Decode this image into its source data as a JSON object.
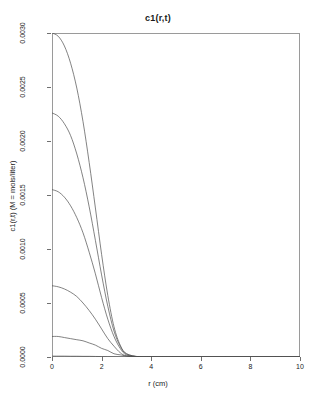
{
  "chart_data": {
    "type": "line",
    "title": "c1(r,t)",
    "xlabel": "r (cm)",
    "ylabel": "c1(r,t) (M = mols/liter)",
    "xlim": [
      0,
      10
    ],
    "ylim": [
      0,
      0.003
    ],
    "grid": false,
    "legend": "none",
    "xticks": [
      "0",
      "2",
      "4",
      "6",
      "8",
      "10"
    ],
    "xtick_values": [
      0,
      2,
      4,
      6,
      8,
      10
    ],
    "yticks": [
      "0.0000",
      "0.0005",
      "0.0010",
      "0.0015",
      "0.0020",
      "0.0025",
      "0.0030"
    ],
    "ytick_values": [
      0.0,
      0.0005,
      0.001,
      0.0015,
      0.002,
      0.0025,
      0.003
    ],
    "x": [
      0,
      0.25,
      0.5,
      0.75,
      1,
      1.25,
      1.5,
      1.75,
      2,
      2.25,
      2.5,
      2.75,
      3,
      3.5,
      4,
      5,
      6,
      7,
      8,
      9,
      10
    ],
    "series": [
      {
        "name": "t1",
        "values": [
          0.003,
          0.00297,
          0.00288,
          0.00272,
          0.00249,
          0.00218,
          0.0018,
          0.00138,
          0.00095,
          0.00057,
          0.00028,
          0.00011,
          3e-05,
          2e-06,
          0.0,
          0.0,
          0.0,
          0.0,
          0.0,
          0.0,
          0.0
        ]
      },
      {
        "name": "t2",
        "values": [
          0.00226,
          0.00223,
          0.00216,
          0.00205,
          0.00188,
          0.00166,
          0.00139,
          0.00108,
          0.00076,
          0.00047,
          0.00024,
          0.0001,
          3e-05,
          2e-06,
          0.0,
          0.0,
          0.0,
          0.0,
          0.0,
          0.0,
          0.0
        ]
      },
      {
        "name": "t3",
        "values": [
          0.00155,
          0.00153,
          0.00148,
          0.0014,
          0.00129,
          0.00115,
          0.00097,
          0.00077,
          0.00055,
          0.00035,
          0.00019,
          8e-05,
          2e-05,
          2e-06,
          0.0,
          0.0,
          0.0,
          0.0,
          0.0,
          0.0,
          0.0
        ]
      },
      {
        "name": "t4",
        "values": [
          0.00066,
          0.00065,
          0.00063,
          0.0006,
          0.00056,
          0.0005,
          0.00043,
          0.00035,
          0.00026,
          0.00017,
          0.0001,
          4e-05,
          1e-05,
          1e-06,
          0.0,
          0.0,
          0.0,
          0.0,
          0.0,
          0.0,
          0.0
        ]
      },
      {
        "name": "t5",
        "values": [
          0.00019,
          0.00019,
          0.00018,
          0.00017,
          0.00016,
          0.00015,
          0.00013,
          0.00011,
          8e-05,
          6e-05,
          3e-05,
          2e-05,
          1e-05,
          1e-06,
          0.0,
          0.0,
          0.0,
          0.0,
          0.0,
          0.0,
          0.0
        ]
      },
      {
        "name": "t6",
        "values": [
          8e-06,
          8e-06,
          8e-06,
          7e-06,
          7e-06,
          6e-06,
          6e-06,
          5e-06,
          4e-06,
          3e-06,
          2e-06,
          1e-06,
          1e-06,
          0.0,
          0.0,
          0.0,
          0.0,
          0.0,
          0.0,
          0.0,
          0.0
        ]
      }
    ]
  }
}
